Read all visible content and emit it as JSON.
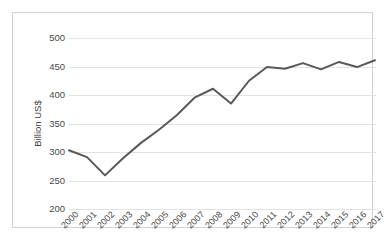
{
  "chart_data": {
    "type": "line",
    "title": "",
    "subtitle": "",
    "xlabel": "",
    "ylabel": "Billion US$",
    "categories": [
      "2000",
      "2001",
      "2002",
      "2003",
      "2004",
      "2005",
      "2006",
      "2007",
      "2008",
      "2009",
      "2010",
      "2011",
      "2012",
      "2013",
      "2014",
      "2015",
      "2016",
      "2017"
    ],
    "x": [
      2000,
      2001,
      2002,
      2003,
      2004,
      2005,
      2006,
      2007,
      2008,
      2009,
      2010,
      2011,
      2012,
      2013,
      2014,
      2015,
      2016,
      2017
    ],
    "series": [
      {
        "name": "Billion US$",
        "color": "#595959",
        "values": [
          303,
          291,
          259,
          289,
          316,
          339,
          365,
          396,
          411,
          385,
          425,
          449,
          446,
          456,
          445,
          458,
          449,
          461
        ]
      }
    ],
    "ylim": [
      200,
      500
    ],
    "ytick_values": [
      200,
      250,
      300,
      350,
      400,
      450,
      500
    ],
    "ytick_labels": [
      "200",
      "250",
      "300",
      "350",
      "400",
      "450",
      "500"
    ],
    "xtick_labels": [
      "2000",
      "2001",
      "2002",
      "2003",
      "2004",
      "2005",
      "2006",
      "2007",
      "2008",
      "2009",
      "2010",
      "2011",
      "2012",
      "2013",
      "2014",
      "2015",
      "2016",
      "2017"
    ],
    "grid": "horizontal",
    "legend": "none",
    "legend_position": "",
    "annotations": [],
    "style": {
      "gridline_color": "#e2e2e2",
      "axis_text_color": "#4a4a4a",
      "line_color": "#595959",
      "line_width": 2,
      "plot_background": "#ffffff",
      "frame_border_color": "#d0d0d0"
    }
  }
}
